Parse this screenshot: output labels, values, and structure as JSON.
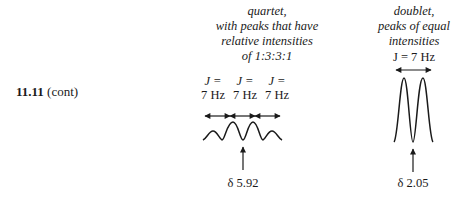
{
  "problem": {
    "number": "11.11",
    "suffix": "(cont)"
  },
  "quartet": {
    "caption_lines": [
      "quartet,",
      "with peaks that have",
      "relative intensities",
      "of 1:3:3:1"
    ],
    "coupling_labels": [
      {
        "j": "J =",
        "value": "7 Hz"
      },
      {
        "j": "J =",
        "value": "7 Hz"
      },
      {
        "j": "J =",
        "value": "7 Hz"
      }
    ],
    "shift_label": "δ 5.92",
    "relative_intensities": [
      1,
      3,
      3,
      1
    ]
  },
  "doublet": {
    "caption_lines": [
      "doublet,",
      "peaks of equal",
      "intensities"
    ],
    "coupling_label": "J = 7 Hz",
    "shift_label": "δ 2.05",
    "relative_intensities": [
      1,
      1
    ]
  },
  "colors": {
    "ink": "#1a1a1a",
    "background": "#ffffff"
  }
}
